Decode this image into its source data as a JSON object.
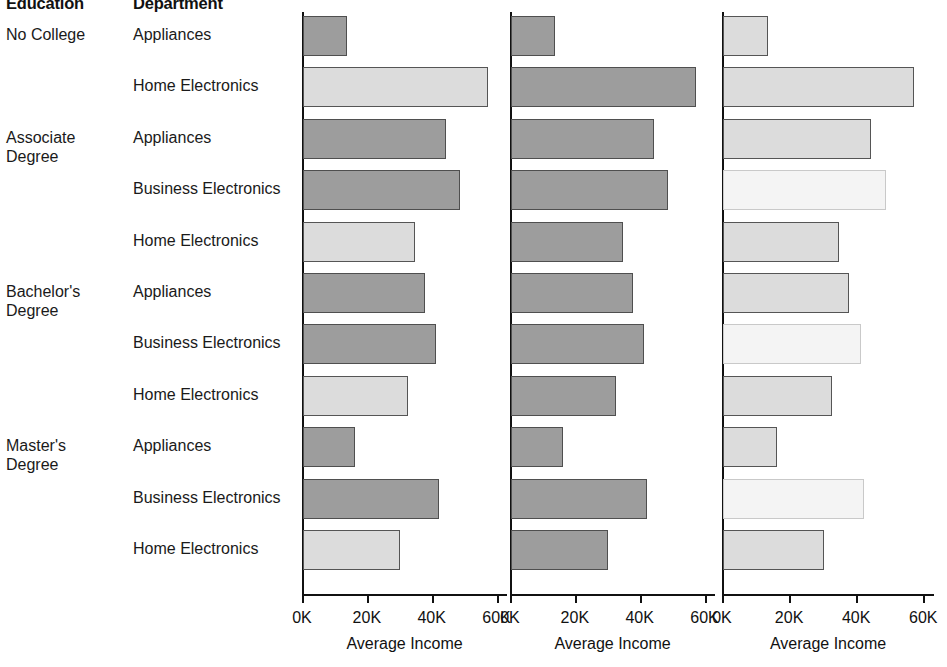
{
  "headers": {
    "education": "Education",
    "department": "Department"
  },
  "axis": {
    "title": "Average Income",
    "tick_labels": [
      "0K",
      "20K",
      "40K",
      "60K"
    ],
    "tick_values": [
      0,
      20000,
      40000,
      60000
    ],
    "min": 0,
    "max": 62000
  },
  "education_groups": [
    {
      "label": "No College",
      "row_span": 2
    },
    {
      "label": "Associate\nDegree",
      "row_span": 3
    },
    {
      "label": "Bachelor's\nDegree",
      "row_span": 3
    },
    {
      "label": "Master's\nDegree",
      "row_span": 3
    }
  ],
  "chart_data": {
    "type": "bar",
    "orientation": "horizontal",
    "title": "",
    "xlabel": "Average Income",
    "ylabel": "",
    "xlim": [
      0,
      62000
    ],
    "grid": false,
    "legend": "none",
    "panel_count": 3,
    "panel_axis_titles": [
      "Average Income",
      "Average Income",
      "Average Income"
    ],
    "shade_colors": {
      "mid": "#9d9d9d",
      "light": "#dcdcdc",
      "pale": "#f4f4f4"
    },
    "categories": [
      "No College / Appliances",
      "No College / Home Electronics",
      "Associate Degree / Appliances",
      "Associate Degree / Business Electronics",
      "Associate Degree / Home Electronics",
      "Bachelor's Degree / Appliances",
      "Bachelor's Degree / Business Electronics",
      "Bachelor's Degree / Home Electronics",
      "Master's Degree / Appliances",
      "Master's Degree / Business Electronics",
      "Master's Degree / Home Electronics"
    ],
    "values": [
      13500,
      57000,
      44000,
      48500,
      34500,
      37500,
      41000,
      32500,
      16000,
      42000,
      30000
    ]
  },
  "rows": [
    {
      "education": "No College",
      "department": "Appliances",
      "value": 13500,
      "shades": [
        "mid",
        "mid",
        "light"
      ]
    },
    {
      "education": "",
      "department": "Home Electronics",
      "value": 57000,
      "shades": [
        "light",
        "mid",
        "light"
      ]
    },
    {
      "education": "Associate Degree",
      "department": "Appliances",
      "value": 44000,
      "shades": [
        "mid",
        "mid",
        "light"
      ]
    },
    {
      "education": "",
      "department": "Business Electronics",
      "value": 48500,
      "shades": [
        "mid",
        "mid",
        "pale"
      ]
    },
    {
      "education": "",
      "department": "Home Electronics",
      "value": 34500,
      "shades": [
        "light",
        "mid",
        "light"
      ]
    },
    {
      "education": "Bachelor's Degree",
      "department": "Appliances",
      "value": 37500,
      "shades": [
        "mid",
        "mid",
        "light"
      ]
    },
    {
      "education": "",
      "department": "Business Electronics",
      "value": 41000,
      "shades": [
        "mid",
        "mid",
        "pale"
      ]
    },
    {
      "education": "",
      "department": "Home Electronics",
      "value": 32500,
      "shades": [
        "light",
        "mid",
        "light"
      ]
    },
    {
      "education": "Master's Degree",
      "department": "Appliances",
      "value": 16000,
      "shades": [
        "mid",
        "mid",
        "light"
      ]
    },
    {
      "education": "",
      "department": "Business Electronics",
      "value": 42000,
      "shades": [
        "mid",
        "mid",
        "pale"
      ]
    },
    {
      "education": "",
      "department": "Home Electronics",
      "value": 30000,
      "shades": [
        "light",
        "mid",
        "light"
      ]
    }
  ]
}
